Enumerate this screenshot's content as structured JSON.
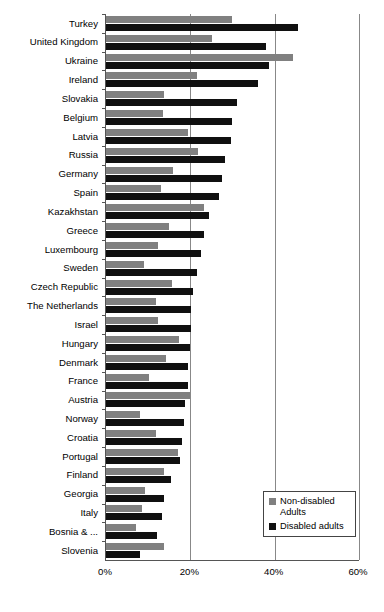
{
  "chart_data": {
    "type": "bar",
    "orientation": "horizontal",
    "title": "",
    "subtitle": "",
    "xlabel": "",
    "ylabel": "",
    "xlim": [
      0,
      60
    ],
    "xunit": "%",
    "xticks": [
      0,
      20,
      40,
      60
    ],
    "xticklabels": [
      "0%",
      "20%",
      "40%",
      "60%"
    ],
    "grid": "vertical",
    "legend_position": "bottom-right",
    "categories": [
      "Turkey",
      "United Kingdom",
      "Ukraine",
      "Ireland",
      "Slovakia",
      "Belgium",
      "Latvia",
      "Russia",
      "Germany",
      "Spain",
      "Kazakhstan",
      "Greece",
      "Luxembourg",
      "Sweden",
      "Czech Republic",
      "The Netherlands",
      "Israel",
      "Hungary",
      "Denmark",
      "France",
      "Austria",
      "Norway",
      "Croatia",
      "Portugal",
      "Finland",
      "Georgia",
      "Italy",
      "Bosnia & ...",
      "Slovenia"
    ],
    "series": [
      {
        "name": "Non-disabled Adults",
        "color": "#808080",
        "values": [
          29.8,
          25.1,
          44.3,
          21.6,
          13.7,
          13.5,
          19.4,
          21.8,
          15.9,
          13.0,
          23.2,
          15.0,
          12.3,
          9.0,
          15.7,
          11.9,
          12.3,
          17.3,
          14.2,
          10.2,
          19.9,
          8.1,
          11.9,
          17.1,
          13.7,
          9.2,
          8.5,
          7.1,
          13.7
        ]
      },
      {
        "name": "Disabled adults",
        "color": "#101010",
        "values": [
          45.5,
          38.0,
          38.7,
          36.0,
          31.0,
          29.9,
          29.6,
          28.2,
          27.5,
          26.8,
          24.4,
          23.2,
          22.6,
          21.6,
          20.6,
          20.2,
          20.2,
          19.9,
          19.4,
          19.4,
          18.7,
          18.5,
          18.0,
          17.5,
          15.4,
          13.7,
          13.3,
          12.1,
          8.1
        ]
      }
    ]
  },
  "legend": {
    "items": [
      {
        "label": "Non-disabled\nAdults",
        "color": "#808080"
      },
      {
        "label": "Disabled adults",
        "color": "#101010"
      }
    ]
  }
}
